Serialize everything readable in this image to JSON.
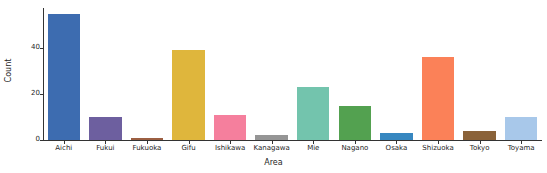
{
  "chart_data": {
    "type": "bar",
    "title": "",
    "xlabel": "Area",
    "ylabel": "Count",
    "categories": [
      "Aichi",
      "Fukui",
      "Fukuoka",
      "Gifu",
      "Ishikawa",
      "Kanagawa",
      "Mie",
      "Nagano",
      "Osaka",
      "Shizuoka",
      "Tokyo",
      "Toyama"
    ],
    "values": [
      55,
      10,
      1,
      39,
      11,
      2,
      23,
      15,
      3,
      36,
      4,
      10
    ],
    "colors": [
      "#3b6ab0",
      "#6d5f9c",
      "#9c5b3f",
      "#dfb73c",
      "#f47f9e",
      "#949494",
      "#74c3ac",
      "#54a košto"
    ],
    "bar_colors": [
      "#3d6cb0",
      "#6d5f9f",
      "#9c5f42",
      "#dfb63c",
      "#f57f9d",
      "#959595",
      "#73c4ad",
      "#53a150",
      "#3787c0",
      "#fb8158",
      "#8a6239",
      "#a8c8ea"
    ],
    "ylim": [
      0,
      57.5
    ],
    "yticks": [
      0,
      20,
      40
    ],
    "ytick_labels": [
      "0",
      "20",
      "40"
    ],
    "grid": false,
    "legend": "none"
  }
}
